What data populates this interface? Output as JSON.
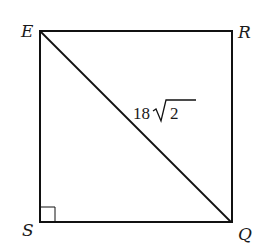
{
  "diagram": {
    "type": "geometry",
    "shape": "square",
    "vertices": {
      "E": {
        "label": "E"
      },
      "R": {
        "label": "R"
      },
      "S": {
        "label": "S"
      },
      "Q": {
        "label": "Q"
      }
    },
    "diagonal": {
      "from": "E",
      "to": "Q",
      "length_label": "18",
      "radical": "2"
    },
    "right_angle_at": "S",
    "colors": {
      "stroke": "#111111",
      "background": "#ffffff"
    }
  }
}
